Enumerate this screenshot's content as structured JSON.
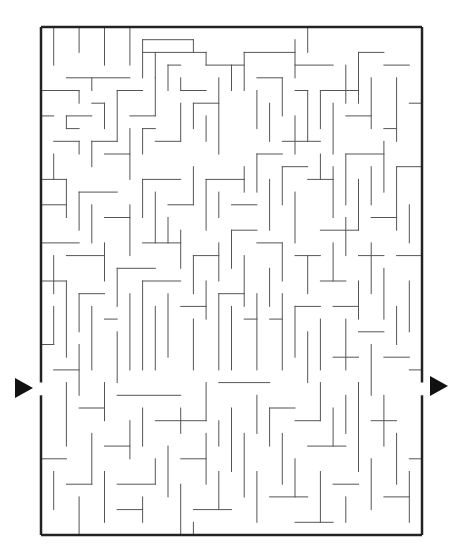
{
  "maze": {
    "cols": 30,
    "rows": 40,
    "origin": [
      41,
      27
    ],
    "cell": 12.7,
    "wall_color": "#555555",
    "border_color": "#222222",
    "entrance": {
      "side": "left",
      "row": 28,
      "arrow": "right-pointing-triangle"
    },
    "exit": {
      "side": "right",
      "row": 28,
      "arrow": "right-pointing-triangle"
    },
    "walls": [
      [
        1,
        0,
        1,
        3
      ],
      [
        3,
        0,
        3,
        2
      ],
      [
        5,
        0,
        5,
        3
      ],
      [
        7,
        0,
        7,
        3
      ],
      [
        8,
        1,
        12,
        1
      ],
      [
        8,
        1,
        8,
        4
      ],
      [
        8,
        2,
        13,
        2
      ],
      [
        9,
        2,
        9,
        4
      ],
      [
        12,
        1,
        12,
        2
      ],
      [
        2,
        4,
        7,
        4
      ],
      [
        4,
        4,
        4,
        5
      ],
      [
        1,
        5,
        3,
        5
      ],
      [
        3,
        5,
        3,
        6
      ],
      [
        4,
        6,
        5,
        6
      ],
      [
        5,
        6,
        5,
        8
      ],
      [
        2,
        7,
        4,
        7
      ],
      [
        2,
        7,
        2,
        8
      ],
      [
        2,
        8,
        3,
        8
      ],
      [
        6,
        5,
        8,
        5
      ],
      [
        6,
        5,
        6,
        9
      ],
      [
        7,
        7,
        9,
        7
      ],
      [
        9,
        4,
        9,
        7
      ],
      [
        10,
        3,
        11,
        3
      ],
      [
        10,
        3,
        10,
        5
      ],
      [
        11,
        5,
        13,
        5
      ],
      [
        11,
        4,
        11,
        5
      ],
      [
        0,
        5,
        1,
        5
      ],
      [
        0,
        7,
        1,
        7
      ],
      [
        1,
        9,
        3,
        9
      ],
      [
        3,
        9,
        3,
        10
      ],
      [
        0,
        12,
        2,
        12
      ],
      [
        2,
        12,
        2,
        15
      ],
      [
        1,
        10,
        1,
        12
      ],
      [
        4,
        9,
        6,
        9
      ],
      [
        4,
        9,
        4,
        11
      ],
      [
        5,
        10,
        7,
        10
      ],
      [
        7,
        8,
        7,
        12
      ],
      [
        8,
        8,
        9,
        8
      ],
      [
        8,
        8,
        8,
        10
      ],
      [
        9,
        9,
        11,
        9
      ],
      [
        11,
        6,
        11,
        9
      ],
      [
        12,
        6,
        14,
        6
      ],
      [
        12,
        6,
        12,
        8
      ],
      [
        13,
        7,
        13,
        9
      ],
      [
        14,
        4,
        14,
        10
      ],
      [
        13,
        2,
        13,
        3
      ],
      [
        13,
        3,
        16,
        3
      ],
      [
        15,
        3,
        15,
        5
      ],
      [
        16,
        2,
        20,
        2
      ],
      [
        16,
        2,
        16,
        5
      ],
      [
        17,
        4,
        19,
        4
      ],
      [
        19,
        4,
        19,
        7
      ],
      [
        17,
        5,
        17,
        8
      ],
      [
        18,
        6,
        18,
        9
      ],
      [
        20,
        1,
        20,
        4
      ],
      [
        20,
        3,
        23,
        3
      ],
      [
        21,
        0,
        21,
        2
      ],
      [
        22,
        5,
        25,
        5
      ],
      [
        22,
        5,
        22,
        8
      ],
      [
        23,
        6,
        23,
        10
      ],
      [
        24,
        3,
        24,
        6
      ],
      [
        25,
        2,
        27,
        2
      ],
      [
        25,
        2,
        25,
        6
      ],
      [
        26,
        4,
        26,
        8
      ],
      [
        27,
        3,
        29,
        3
      ],
      [
        28,
        4,
        28,
        9
      ],
      [
        29,
        6,
        30,
        6
      ],
      [
        27,
        8,
        28,
        8
      ],
      [
        24,
        7,
        26,
        7
      ],
      [
        20,
        5,
        21,
        5
      ],
      [
        21,
        5,
        21,
        9
      ],
      [
        20,
        7,
        20,
        10
      ],
      [
        19,
        9,
        22,
        9
      ],
      [
        0,
        14,
        2,
        14
      ],
      [
        3,
        13,
        6,
        13
      ],
      [
        3,
        13,
        3,
        16
      ],
      [
        4,
        14,
        4,
        17
      ],
      [
        5,
        15,
        7,
        15
      ],
      [
        7,
        14,
        7,
        18
      ],
      [
        8,
        12,
        11,
        12
      ],
      [
        8,
        12,
        8,
        15
      ],
      [
        9,
        13,
        9,
        17
      ],
      [
        10,
        14,
        12,
        14
      ],
      [
        12,
        11,
        12,
        14
      ],
      [
        13,
        12,
        16,
        12
      ],
      [
        13,
        12,
        13,
        16
      ],
      [
        14,
        13,
        14,
        15
      ],
      [
        15,
        14,
        17,
        14
      ],
      [
        16,
        11,
        16,
        13
      ],
      [
        17,
        10,
        19,
        10
      ],
      [
        17,
        10,
        17,
        13
      ],
      [
        18,
        12,
        18,
        16
      ],
      [
        19,
        11,
        21,
        11
      ],
      [
        19,
        11,
        19,
        14
      ],
      [
        20,
        13,
        20,
        17
      ],
      [
        21,
        12,
        23,
        12
      ],
      [
        22,
        10,
        22,
        12
      ],
      [
        23,
        11,
        23,
        15
      ],
      [
        24,
        10,
        27,
        10
      ],
      [
        24,
        10,
        24,
        14
      ],
      [
        25,
        12,
        25,
        16
      ],
      [
        26,
        11,
        26,
        14
      ],
      [
        27,
        9,
        27,
        13
      ],
      [
        28,
        11,
        30,
        11
      ],
      [
        28,
        11,
        28,
        16
      ],
      [
        29,
        14,
        29,
        17
      ],
      [
        26,
        15,
        28,
        15
      ],
      [
        24,
        15,
        24,
        18
      ],
      [
        22,
        16,
        25,
        16
      ],
      [
        0,
        17,
        3,
        17
      ],
      [
        1,
        18,
        1,
        21
      ],
      [
        2,
        18,
        5,
        18
      ],
      [
        5,
        17,
        5,
        20
      ],
      [
        6,
        19,
        9,
        19
      ],
      [
        6,
        19,
        6,
        22
      ],
      [
        8,
        17,
        11,
        17
      ],
      [
        10,
        15,
        10,
        17
      ],
      [
        11,
        16,
        11,
        19
      ],
      [
        12,
        18,
        14,
        18
      ],
      [
        12,
        18,
        12,
        21
      ],
      [
        14,
        17,
        14,
        20
      ],
      [
        15,
        16,
        17,
        16
      ],
      [
        15,
        16,
        15,
        19
      ],
      [
        16,
        18,
        16,
        22
      ],
      [
        17,
        17,
        19,
        17
      ],
      [
        19,
        17,
        19,
        20
      ],
      [
        18,
        19,
        18,
        22
      ],
      [
        20,
        18,
        22,
        18
      ],
      [
        21,
        18,
        21,
        21
      ],
      [
        22,
        20,
        24,
        20
      ],
      [
        23,
        17,
        23,
        20
      ],
      [
        25,
        18,
        27,
        18
      ],
      [
        26,
        17,
        26,
        21
      ],
      [
        27,
        19,
        27,
        23
      ],
      [
        28,
        18,
        30,
        18
      ],
      [
        29,
        20,
        29,
        24
      ],
      [
        25,
        20,
        25,
        23
      ],
      [
        0,
        20,
        2,
        20
      ],
      [
        2,
        20,
        2,
        26
      ],
      [
        1,
        22,
        1,
        25
      ],
      [
        3,
        21,
        5,
        21
      ],
      [
        3,
        21,
        3,
        24
      ],
      [
        4,
        22,
        4,
        27
      ],
      [
        5,
        23,
        6,
        23
      ],
      [
        6,
        24,
        6,
        28
      ],
      [
        7,
        21,
        7,
        27
      ],
      [
        8,
        20,
        11,
        20
      ],
      [
        8,
        20,
        8,
        27
      ],
      [
        9,
        22,
        9,
        27
      ],
      [
        10,
        21,
        10,
        26
      ],
      [
        11,
        22,
        13,
        22
      ],
      [
        13,
        20,
        13,
        23
      ],
      [
        12,
        23,
        12,
        27
      ],
      [
        14,
        21,
        16,
        21
      ],
      [
        14,
        21,
        14,
        27
      ],
      [
        15,
        22,
        15,
        27
      ],
      [
        16,
        23,
        17,
        23
      ],
      [
        17,
        21,
        17,
        27
      ],
      [
        18,
        23,
        19,
        23
      ],
      [
        19,
        21,
        19,
        27
      ],
      [
        20,
        22,
        22,
        22
      ],
      [
        20,
        22,
        20,
        26
      ],
      [
        21,
        24,
        21,
        28
      ],
      [
        22,
        23,
        22,
        27
      ],
      [
        23,
        22,
        25,
        22
      ],
      [
        24,
        23,
        24,
        27
      ],
      [
        25,
        24,
        27,
        24
      ],
      [
        26,
        25,
        26,
        29
      ],
      [
        27,
        26,
        29,
        26
      ],
      [
        28,
        22,
        28,
        25
      ],
      [
        29,
        27,
        30,
        27
      ],
      [
        23,
        26,
        25,
        26
      ],
      [
        0,
        25,
        1,
        25
      ],
      [
        1,
        27,
        3,
        27
      ],
      [
        3,
        25,
        3,
        29
      ],
      [
        2,
        28,
        2,
        33
      ],
      [
        3,
        30,
        5,
        30
      ],
      [
        5,
        28,
        5,
        31
      ],
      [
        4,
        32,
        4,
        36
      ],
      [
        5,
        33,
        7,
        33
      ],
      [
        6,
        29,
        11,
        29
      ],
      [
        7,
        31,
        7,
        34
      ],
      [
        8,
        30,
        8,
        33
      ],
      [
        9,
        31,
        13,
        31
      ],
      [
        11,
        30,
        11,
        32
      ],
      [
        13,
        28,
        13,
        31
      ],
      [
        14,
        28,
        18,
        28
      ],
      [
        10,
        33,
        10,
        37
      ],
      [
        11,
        34,
        13,
        34
      ],
      [
        13,
        32,
        13,
        36
      ],
      [
        14,
        31,
        14,
        33
      ],
      [
        15,
        30,
        15,
        35
      ],
      [
        16,
        32,
        16,
        37
      ],
      [
        17,
        29,
        17,
        32
      ],
      [
        18,
        30,
        20,
        30
      ],
      [
        18,
        30,
        18,
        33
      ],
      [
        19,
        32,
        19,
        36
      ],
      [
        20,
        31,
        22,
        31
      ],
      [
        22,
        28,
        22,
        31
      ],
      [
        21,
        33,
        24,
        33
      ],
      [
        23,
        30,
        23,
        33
      ],
      [
        24,
        29,
        24,
        32
      ],
      [
        25,
        28,
        25,
        35
      ],
      [
        26,
        31,
        28,
        31
      ],
      [
        27,
        29,
        27,
        33
      ],
      [
        28,
        32,
        28,
        36
      ],
      [
        29,
        34,
        30,
        34
      ],
      [
        26,
        34,
        26,
        38
      ],
      [
        0,
        34,
        2,
        34
      ],
      [
        1,
        35,
        1,
        38
      ],
      [
        2,
        36,
        4,
        36
      ],
      [
        3,
        37,
        3,
        40
      ],
      [
        5,
        35,
        5,
        39
      ],
      [
        6,
        36,
        9,
        36
      ],
      [
        6,
        38,
        8,
        38
      ],
      [
        8,
        37,
        8,
        39
      ],
      [
        9,
        34,
        9,
        36
      ],
      [
        11,
        36,
        11,
        40
      ],
      [
        12,
        38,
        15,
        38
      ],
      [
        14,
        35,
        14,
        38
      ],
      [
        17,
        35,
        17,
        39
      ],
      [
        18,
        37,
        21,
        37
      ],
      [
        20,
        34,
        20,
        37
      ],
      [
        22,
        35,
        22,
        39
      ],
      [
        23,
        36,
        25,
        36
      ],
      [
        24,
        37,
        24,
        39
      ],
      [
        27,
        37,
        29,
        37
      ],
      [
        29,
        35,
        29,
        39
      ],
      [
        20,
        39,
        23,
        39
      ],
      [
        12,
        39,
        12,
        40
      ]
    ]
  }
}
